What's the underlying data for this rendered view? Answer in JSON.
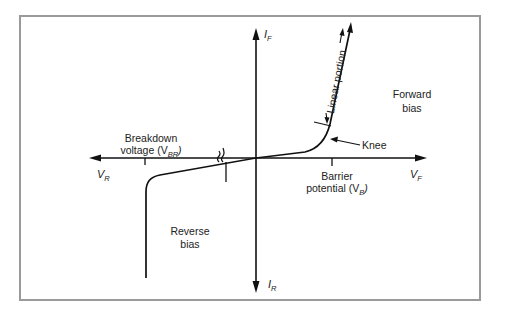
{
  "diagram": {
    "frame_color": "#9a9a9a",
    "line_color": "#111111",
    "axes": {
      "y_positive": {
        "symbol": "I",
        "subscript": "F"
      },
      "y_negative": {
        "symbol": "I",
        "subscript": "R"
      },
      "x_positive": {
        "symbol": "V",
        "subscript": "F"
      },
      "x_negative": {
        "symbol": "V",
        "subscript": "R"
      }
    },
    "labels": {
      "forward_bias_line1": "Forward",
      "forward_bias_line2": "bias",
      "reverse_bias_line1": "Reverse",
      "reverse_bias_line2": "bias",
      "breakdown_line1": "Breakdown",
      "breakdown_line2_text": "voltage (V",
      "breakdown_sub": "BR",
      "breakdown_close": ")",
      "barrier_line1": "Barrier",
      "barrier_line2_text": "potential (V",
      "barrier_sub": "B",
      "barrier_close": ")",
      "knee": "Knee",
      "linear_portion": "Linear portion"
    }
  }
}
